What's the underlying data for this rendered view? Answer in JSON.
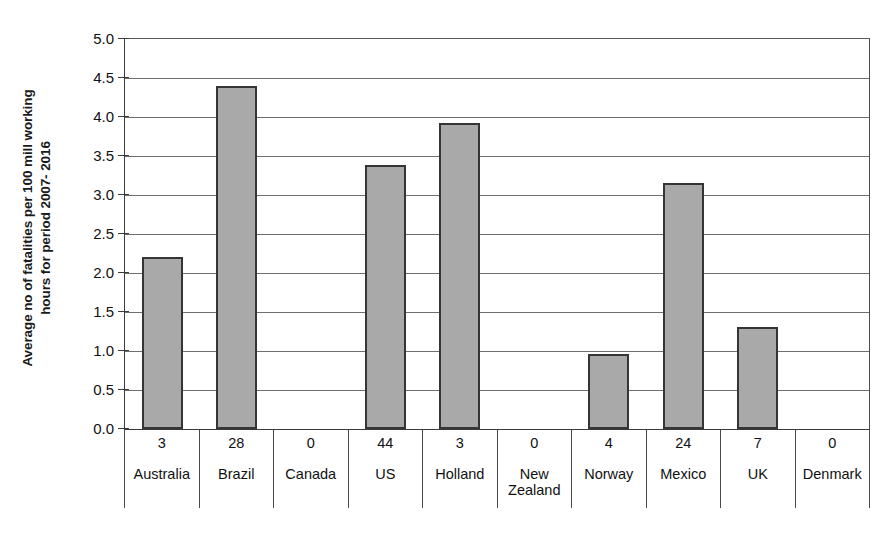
{
  "chart_data": {
    "type": "bar",
    "title": "",
    "xlabel": "",
    "ylabel": "Average no of fatalities per 100 mill working hours for period 2007- 2016",
    "ylabel_lines": [
      "Average no of fatalities per 100 mill working",
      "hours for period 2007- 2016"
    ],
    "ylim": [
      0.0,
      5.0
    ],
    "ytick_labels": [
      "5.0",
      "4.5",
      "4.0",
      "3.5",
      "3.0",
      "2.5",
      "2.0",
      "1.5",
      "1.0",
      "0.5",
      "0.0"
    ],
    "ytick_values": [
      5.0,
      4.5,
      4.0,
      3.5,
      3.0,
      2.5,
      2.0,
      1.5,
      1.0,
      0.5,
      0.0
    ],
    "grid": true,
    "legend": false,
    "categories": [
      "Australia",
      "Brazil",
      "Canada",
      "US",
      "Holland",
      "New Zealand",
      "Norway",
      "Mexico",
      "UK",
      "Denmark"
    ],
    "values": [
      2.21,
      4.4,
      0.0,
      3.38,
      3.92,
      0.0,
      0.96,
      3.15,
      1.31,
      0.0
    ],
    "bar_color": "#a9a9a9",
    "bar_edge_color": "#353535"
  },
  "table": {
    "count_row_label": "",
    "counts": [
      "3",
      "28",
      "0",
      "44",
      "3",
      "0",
      "4",
      "24",
      "7",
      "0"
    ],
    "names": [
      "Australia",
      "Brazil",
      "Canada",
      "US",
      "Holland",
      "New Zealand",
      "Norway",
      "Mexico",
      "UK",
      "Denmark"
    ]
  }
}
